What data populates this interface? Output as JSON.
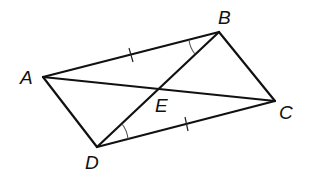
{
  "diagram": {
    "type": "quadrilateral with diagonals",
    "vertices": {
      "A": {
        "label": "A"
      },
      "B": {
        "label": "B"
      },
      "C": {
        "label": "C"
      },
      "D": {
        "label": "D"
      },
      "E": {
        "label": "E"
      }
    },
    "sides": [
      "AB",
      "BC",
      "CD",
      "DA"
    ],
    "diagonals": [
      "AC",
      "BD"
    ],
    "intersection": "E",
    "congruent_segments": [
      "AB",
      "DC"
    ],
    "congruent_angles": [
      "ABD",
      "BDC"
    ],
    "colors": {
      "line": "#111111",
      "marker": "#555555",
      "background": "#ffffff"
    }
  }
}
